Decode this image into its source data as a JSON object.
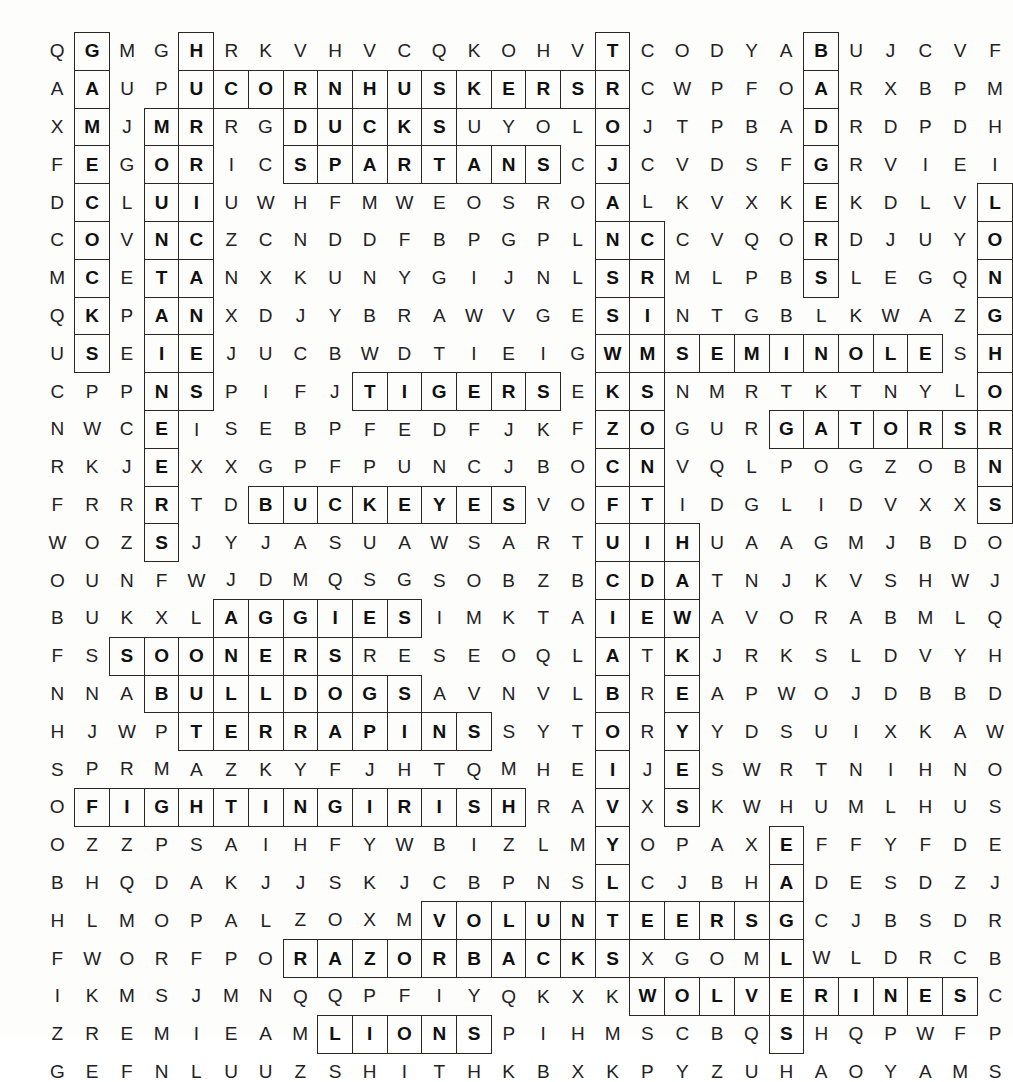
{
  "puzzle": {
    "type": "word-search",
    "title": "College Football Teams Word Search",
    "rows": 25,
    "cols": 26,
    "ink_color": "#24211f",
    "highlight_outline_color": "#2a2725",
    "background_color": "#fdfdfc",
    "grid": [
      "QGMGHRKVHVCQKOHVTCODYABUJCVF",
      "AAUPUCORNHUSKERSRCWPFOARXBPM",
      "XMJMRRGDUCKSUYOLOJTPBADRDPDH",
      "FEGORICSPARTANSCJCVDSFGRVIEI",
      "DCLUIUWHFMWEOSROALKVXKEKDLVL",
      "COVNCZCNDDFBPGPLNCCVQORDJUYO",
      "MCETANXKUNYGIJNLSRMLPBSLEGQN",
      "QKPANXDJYBRAWVGESINTGBLKWAZG",
      "USEIEJUCBWDTIEIGWMSEMINOLESH",
      "CPPNSPIFJTIGERSEKSNMRTKTNYLO",
      "NWCEISEBPFEDFJKFZOGURGATORSR",
      "RKJEXXGPFPUNCJBOCNVQLPOGZOBN",
      "FRRRTDBUCKEYESVOFTIDGLIDVXXS",
      "WOZSJYJASUAWSARTUIHUAAGMJBDO",
      "OUNFWJDMQSGSOBZBCDATNJKVSHWJ",
      "BUKXLAGGIESIMKTAIEWAVORABMLQ",
      "FSSOONERSRESEOQLATKJRKSLDVYH",
      "NNABULLDOGSAVNVLBREAPWOJDBBD",
      "HJWPTERRAPINSSYTORYYDSUIXKAW",
      "SPRMAZKYFJHTQMHEIJESWRTNIHNO",
      "OFIGHTINGIRISHRAVXSKWHUMLHUS",
      "OZZPSAIHFYWBIZLMYOPAXEFFYFDE",
      "BHQDAKJJSKJCBPNSLCJBHADESDZJ",
      "HLMOPALZOXMVOLUNTEERSGCJBSDR",
      "FWORFPORAZORBACKSXGOMLWLDRCB",
      "IKMSJMNQQPFIYQKXKWOLVERINESC",
      "ZREMIEAMLIONSPIHMSCBQSHQPWFP",
      "GEFNLUUZSHITHKBXKPYZUHAOYAMS"
    ],
    "found_words": [
      {
        "word": "GAMECOCKS",
        "dir": "down",
        "row": 0,
        "col": 1
      },
      {
        "word": "HURRICANES",
        "dir": "down",
        "row": 0,
        "col": 4
      },
      {
        "word": "TROJANS",
        "dir": "down",
        "row": 0,
        "col": 16
      },
      {
        "word": "BADGERS",
        "dir": "down",
        "row": 0,
        "col": 22
      },
      {
        "word": "CORNHUSKERS",
        "dir": "across",
        "row": 1,
        "col": 5
      },
      {
        "word": "MOUNTAINEERS",
        "dir": "down",
        "row": 2,
        "col": 3
      },
      {
        "word": "DUCKS",
        "dir": "across",
        "row": 2,
        "col": 7
      },
      {
        "word": "SPARTANS",
        "dir": "across",
        "row": 3,
        "col": 7
      },
      {
        "word": "COLLEGEFOOTBALLTEAMS",
        "dir": "down",
        "row": 3,
        "col": 16
      },
      {
        "word": "LONGHORNS",
        "dir": "down",
        "row": 4,
        "col": 27
      },
      {
        "word": "CRIMSONTIDE",
        "dir": "down",
        "row": 5,
        "col": 17
      },
      {
        "word": "SEMINOLES",
        "dir": "across",
        "row": 8,
        "col": 17
      },
      {
        "word": "TIGERS",
        "dir": "across",
        "row": 9,
        "col": 9
      },
      {
        "word": "GATORS",
        "dir": "across",
        "row": 10,
        "col": 21
      },
      {
        "word": "BUCKEYES",
        "dir": "across",
        "row": 12,
        "col": 6
      },
      {
        "word": "HAWKEYES",
        "dir": "down",
        "row": 13,
        "col": 18
      },
      {
        "word": "AGGIES",
        "dir": "across",
        "row": 15,
        "col": 5
      },
      {
        "word": "SOONERS",
        "dir": "across",
        "row": 16,
        "col": 2
      },
      {
        "word": "BULLDOGS",
        "dir": "across",
        "row": 17,
        "col": 3
      },
      {
        "word": "TERRAPINS",
        "dir": "across",
        "row": 18,
        "col": 4
      },
      {
        "word": "FIGHTINGIRISH",
        "dir": "across",
        "row": 20,
        "col": 1
      },
      {
        "word": "EAGLES",
        "dir": "down",
        "row": 21,
        "col": 21
      },
      {
        "word": "VOLUNTEERS",
        "dir": "across",
        "row": 23,
        "col": 11
      },
      {
        "word": "RAZORBACKS",
        "dir": "across",
        "row": 24,
        "col": 7
      },
      {
        "word": "WOLVERINES",
        "dir": "across",
        "row": 25,
        "col": 17
      },
      {
        "word": "LIONS",
        "dir": "across",
        "row": 26,
        "col": 8
      }
    ]
  }
}
